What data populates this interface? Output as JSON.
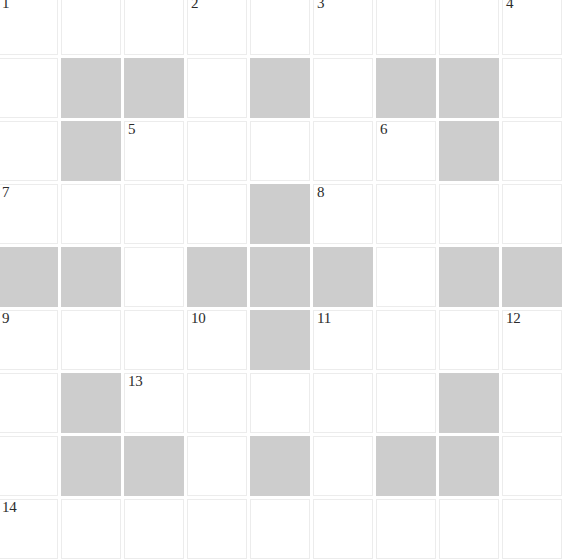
{
  "puzzle": {
    "title": "Crossword Grid",
    "columns": 9,
    "rows": 9,
    "cell_size_px": 60,
    "gap_px": 3,
    "colors": {
      "white_cell": "#ffffff",
      "block_cell": "#cdcdcd",
      "number_text": "#2b2b2b",
      "background": "#ffffff"
    },
    "legend": {
      "white": "open letter square",
      "block": "blocked square"
    },
    "grid": [
      [
        "white",
        "white",
        "white",
        "white",
        "white",
        "white",
        "white",
        "white",
        "white"
      ],
      [
        "white",
        "block",
        "block",
        "white",
        "block",
        "white",
        "block",
        "block",
        "white"
      ],
      [
        "white",
        "block",
        "white",
        "white",
        "white",
        "white",
        "white",
        "block",
        "white"
      ],
      [
        "white",
        "white",
        "white",
        "white",
        "block",
        "white",
        "white",
        "white",
        "white"
      ],
      [
        "block",
        "block",
        "white",
        "block",
        "block",
        "block",
        "white",
        "block",
        "block"
      ],
      [
        "white",
        "white",
        "white",
        "white",
        "block",
        "white",
        "white",
        "white",
        "white"
      ],
      [
        "white",
        "block",
        "white",
        "white",
        "white",
        "white",
        "white",
        "block",
        "white"
      ],
      [
        "white",
        "block",
        "block",
        "white",
        "block",
        "white",
        "block",
        "block",
        "white"
      ],
      [
        "white",
        "white",
        "white",
        "white",
        "white",
        "white",
        "white",
        "white",
        "white"
      ]
    ],
    "numbers": [
      {
        "label": "1",
        "row": 0,
        "col": 0
      },
      {
        "label": "2",
        "row": 0,
        "col": 3
      },
      {
        "label": "3",
        "row": 0,
        "col": 5
      },
      {
        "label": "4",
        "row": 0,
        "col": 8
      },
      {
        "label": "5",
        "row": 2,
        "col": 2
      },
      {
        "label": "6",
        "row": 2,
        "col": 6
      },
      {
        "label": "7",
        "row": 3,
        "col": 0
      },
      {
        "label": "8",
        "row": 3,
        "col": 5
      },
      {
        "label": "9",
        "row": 5,
        "col": 0
      },
      {
        "label": "10",
        "row": 5,
        "col": 3
      },
      {
        "label": "11",
        "row": 5,
        "col": 5
      },
      {
        "label": "12",
        "row": 5,
        "col": 8
      },
      {
        "label": "13",
        "row": 6,
        "col": 2
      },
      {
        "label": "14",
        "row": 8,
        "col": 0
      }
    ]
  }
}
